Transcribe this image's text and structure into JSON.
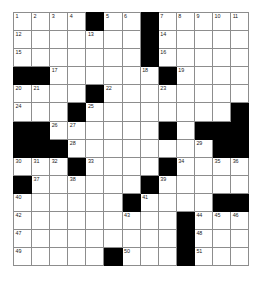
{
  "puzzle": {
    "kind": "crossword-grid",
    "columns": 13,
    "rows": 14,
    "cell_size_px": 18,
    "colors": {
      "block": "#000000",
      "open": "#ffffff",
      "gridline": "#8d8d8d",
      "number": "#1a1a1a",
      "page_background": "#ffffff"
    },
    "blocks": [
      [
        1,
        5
      ],
      [
        1,
        8
      ],
      [
        2,
        8
      ],
      [
        3,
        8
      ],
      [
        4,
        1
      ],
      [
        4,
        2
      ],
      [
        4,
        9
      ],
      [
        5,
        5
      ],
      [
        6,
        4
      ],
      [
        6,
        13
      ],
      [
        7,
        1
      ],
      [
        7,
        2
      ],
      [
        7,
        9
      ],
      [
        7,
        11
      ],
      [
        7,
        12
      ],
      [
        7,
        13
      ],
      [
        8,
        1
      ],
      [
        8,
        2
      ],
      [
        8,
        3
      ],
      [
        8,
        12
      ],
      [
        8,
        13
      ],
      [
        9,
        4
      ],
      [
        9,
        9
      ],
      [
        10,
        1
      ],
      [
        10,
        8
      ],
      [
        11,
        7
      ],
      [
        11,
        12
      ],
      [
        11,
        13
      ],
      [
        12,
        10
      ],
      [
        13,
        10
      ],
      [
        14,
        6
      ],
      [
        14,
        10
      ]
    ],
    "numbers": [
      {
        "row": 1,
        "col": 1,
        "n": "1"
      },
      {
        "row": 1,
        "col": 2,
        "n": "2"
      },
      {
        "row": 1,
        "col": 3,
        "n": "3"
      },
      {
        "row": 1,
        "col": 4,
        "n": "4"
      },
      {
        "row": 1,
        "col": 6,
        "n": "5"
      },
      {
        "row": 1,
        "col": 7,
        "n": "6"
      },
      {
        "row": 1,
        "col": 8,
        "n": "7"
      },
      {
        "row": 1,
        "col": 10,
        "n": "8"
      },
      {
        "row": 1,
        "col": 11,
        "n": "9"
      },
      {
        "row": 1,
        "col": 12,
        "n": "10"
      },
      {
        "row": 1,
        "col": 13,
        "n": "11"
      },
      {
        "row": 2,
        "col": 1,
        "n": "14"
      },
      {
        "row": 2,
        "col": 5,
        "n": "15"
      },
      {
        "row": 2,
        "col": 10,
        "n": "16"
      },
      {
        "row": 3,
        "col": 1,
        "n": "17"
      },
      {
        "row": 3,
        "col": 10,
        "n": "18"
      },
      {
        "row": 4,
        "col": 3,
        "n": "19"
      },
      {
        "row": 4,
        "col": 8,
        "n": "20"
      },
      {
        "row": 4,
        "col": 10,
        "n": "21"
      },
      {
        "row": 5,
        "col": 1,
        "n": "22"
      },
      {
        "row": 5,
        "col": 2,
        "n": "23"
      },
      {
        "row": 5,
        "col": 6,
        "n": "24"
      },
      {
        "row": 5,
        "col": 10,
        "n": "25"
      },
      {
        "row": 6,
        "col": 1,
        "n": "26"
      },
      {
        "row": 6,
        "col": 5,
        "n": "27"
      },
      {
        "row": 6,
        "col": 9,
        "n": "28"
      },
      {
        "row": 6,
        "col": 12,
        "n": "29"
      },
      {
        "row": 7,
        "col": 1,
        "n": "30"
      },
      {
        "row": 7,
        "col": 4,
        "n": "31"
      },
      {
        "row": 7,
        "col": 7,
        "n": "32"
      },
      {
        "row": 7,
        "col": 10,
        "n": "33"
      },
      {
        "row": 8,
        "col": 4,
        "n": "34"
      },
      {
        "row": 8,
        "col": 7,
        "n": "35"
      },
      {
        "row": 8,
        "col": 8,
        "n": "36"
      },
      {
        "row": 8,
        "col": 11,
        "n": "37"
      },
      {
        "row": 9,
        "col": 4,
        "n": "38"
      },
      {
        "row": 9,
        "col": 10,
        "n": "39"
      },
      {
        "row": 9,
        "col": 12,
        "n": "40"
      },
      {
        "row": 9,
        "col": 13,
        "n": "41"
      },
      {
        "row": 10,
        "col": 1,
        "n": "42"
      },
      {
        "row": 10,
        "col": 2,
        "n": "43"
      },
      {
        "row": 10,
        "col": 3,
        "n": "44"
      },
      {
        "row": 10,
        "col": 5,
        "n": "45"
      },
      {
        "row": 10,
        "col": 8,
        "n": "46"
      },
      {
        "row": 10,
        "col": 9,
        "n": "47"
      },
      {
        "row": 10,
        "col": 11,
        "n": "48"
      },
      {
        "row": 11,
        "col": 1,
        "n": "49"
      },
      {
        "row": 11,
        "col": 4,
        "n": "50"
      },
      {
        "row": 11,
        "col": 9,
        "n": "51"
      },
      {
        "row": 11,
        "col": 10,
        "n": "52"
      },
      {
        "row": 12,
        "col": 1,
        "n": "53"
      },
      {
        "row": 12,
        "col": 6,
        "n": "54"
      },
      {
        "row": 12,
        "col": 8,
        "n": "55"
      },
      {
        "row": 13,
        "col": 1,
        "n": "56"
      },
      {
        "row": 13,
        "col": 8,
        "n": "57"
      },
      {
        "row": 13,
        "col": 11,
        "n": "58"
      },
      {
        "row": 13,
        "col": 12,
        "n": "59"
      },
      {
        "row": 13,
        "col": 13,
        "n": "60"
      },
      {
        "row": 14,
        "col": 1,
        "n": "61"
      },
      {
        "row": 14,
        "col": 8,
        "n": "62"
      },
      {
        "row": 14,
        "col": 11,
        "n": "63"
      },
      {
        "row": 14,
        "col": 11,
        "n": "64"
      },
      {
        "row": 14,
        "col": 7,
        "n": "65"
      }
    ],
    "display_numbers": {
      "r1": [
        {
          "col": 1,
          "n": "1"
        },
        {
          "col": 2,
          "n": "2"
        },
        {
          "col": 3,
          "n": "3"
        },
        {
          "col": 4,
          "n": "4"
        },
        {
          "col": 6,
          "n": "5"
        },
        {
          "col": 7,
          "n": "6"
        },
        {
          "col": 8,
          "n": "7"
        },
        {
          "col": 10,
          "n": "8"
        },
        {
          "col": 11,
          "n": "9"
        },
        {
          "col": 12,
          "n": "10"
        },
        {
          "col": 13,
          "n": "11"
        }
      ]
    }
  }
}
